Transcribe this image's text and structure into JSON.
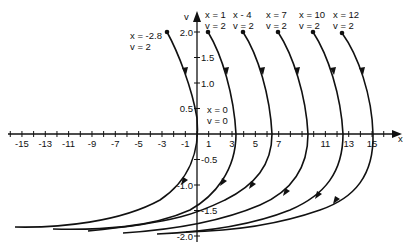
{
  "diagram": {
    "type": "phase-portrait",
    "axes": {
      "x_label": "x",
      "y_label": "v",
      "x_ticks": [
        "-15",
        "-13",
        "-11",
        "-9",
        "-7",
        "-5",
        "-3",
        "-1",
        "1",
        "3",
        "5",
        "7",
        "11",
        "13",
        "15"
      ],
      "x_tick_values": [
        -15,
        -13,
        -11,
        -9,
        -7,
        -5,
        -3,
        -1,
        1,
        3,
        5,
        7,
        11,
        13,
        15
      ],
      "v_ticks_pos": [
        "2.0",
        "1.5",
        "1.0",
        "0.5"
      ],
      "v_tick_values_pos": [
        2.0,
        1.5,
        1.0,
        0.5
      ],
      "v_ticks_neg": [
        "-0.5",
        "-1.0",
        "-1.5",
        "-2.0"
      ],
      "v_tick_values_neg": [
        -0.5,
        -1.0,
        -1.5,
        -2.0
      ]
    },
    "trajectories": [
      {
        "start_x_label": "x = -2.8",
        "start_v_label": "v = 2",
        "x0": -2.8,
        "v0": 2
      },
      {
        "start_x_label": "x = 1",
        "start_v_label": "v = 2",
        "x0": 1,
        "v0": 2
      },
      {
        "start_x_label": "x - 4",
        "start_v_label": "v = 2",
        "x0": 4,
        "v0": 2
      },
      {
        "start_x_label": "x = 7",
        "start_v_label": "v = 2",
        "x0": 7,
        "v0": 2
      },
      {
        "start_x_label": "x = 10",
        "start_v_label": "v = 2",
        "x0": 10,
        "v0": 2
      },
      {
        "start_x_label": "x = 12",
        "start_v_label": "v = 2",
        "x0": 12,
        "v0": 2
      }
    ],
    "origin_label": {
      "x": "x = 0",
      "v": "v = 0"
    }
  }
}
